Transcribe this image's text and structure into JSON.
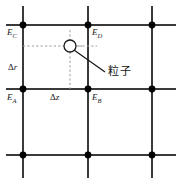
{
  "figure": {
    "title_alt": "",
    "colors": {
      "grid_line": "#3a3a3a",
      "node_fill": "#000000",
      "dashed_line": "#8a8a8a",
      "particle_outline": "#1a1a1a",
      "particle_fill": "#ffffff",
      "leader_line": "#111111",
      "background": "#ffffff",
      "text": "#1a1a1a"
    },
    "labels": {
      "node_c": "E",
      "node_c_sub": "C",
      "node_d": "E",
      "node_d_sub": "D",
      "node_a": "E",
      "node_a_sub": "A",
      "node_b": "E",
      "node_b_sub": "B",
      "delta_r_symbol": "Δ",
      "delta_r_var": "r",
      "delta_z_symbol": "Δ",
      "delta_z_var": "z",
      "particle": "粒子"
    },
    "geometry": {
      "grid_columns_x": [
        23,
        88,
        152
      ],
      "grid_rows_y": [
        25,
        89,
        155
      ],
      "particle_x": 70,
      "particle_y": 46,
      "particle_radius": 6
    }
  }
}
